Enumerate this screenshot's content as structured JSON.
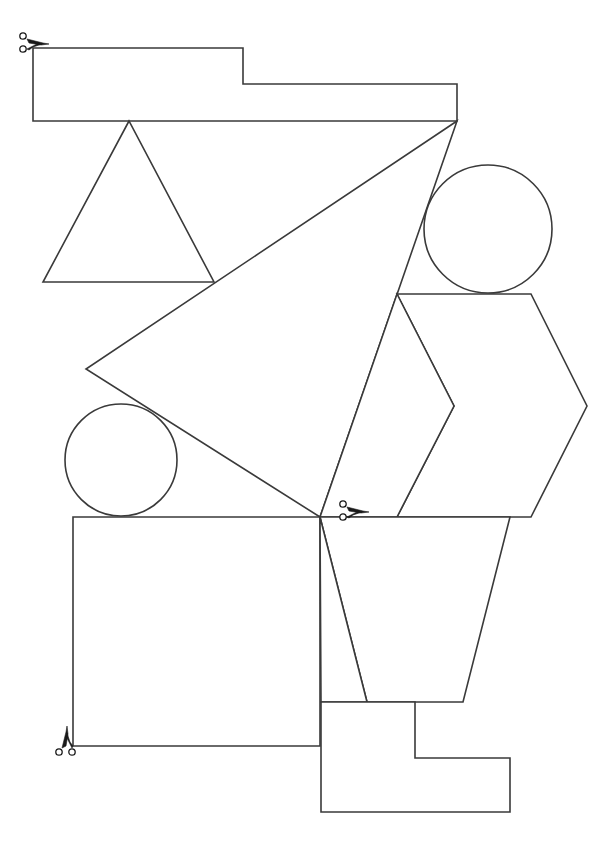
{
  "diagram": {
    "background": "#ffffff",
    "stroke_color": "#3a3a3a",
    "icon_color": "#1a1a1a",
    "shapes": [
      {
        "id": "stepped-bar",
        "type": "polygon",
        "points": "33,48 243,48 243,84 457,84 457,121 33,121"
      },
      {
        "id": "small-triangle",
        "type": "polygon",
        "points": "129,121 43,282 214,282"
      },
      {
        "id": "large-triangle",
        "type": "polygon",
        "points": "457,121 86,369 320,517"
      },
      {
        "id": "upper-circle",
        "type": "circle",
        "cx": 488,
        "cy": 229,
        "r": 64
      },
      {
        "id": "chevron-hexagon",
        "type": "polygon",
        "points": "397,294 531,294 587,406 531,517 397,517 454,406"
      },
      {
        "id": "sliver-quad",
        "type": "polygon",
        "points": "397,294 454,406 397,517 320,517"
      },
      {
        "id": "lower-circle",
        "type": "circle",
        "cx": 121,
        "cy": 460,
        "r": 56
      },
      {
        "id": "square",
        "type": "polygon",
        "points": "73,517 320,517 320,746 73,746"
      },
      {
        "id": "trapezoid",
        "type": "polygon",
        "points": "320,517 510,517 463,702 367,702"
      },
      {
        "id": "left-sliver",
        "type": "polygon",
        "points": "320,517 367,702 321,702"
      },
      {
        "id": "l-block",
        "type": "polygon",
        "points": "321,702 415,702 415,758 510,758 510,812 321,812"
      }
    ],
    "scissors": [
      {
        "id": "scissors-top-left",
        "x": 33,
        "y": 44,
        "rotation": 0
      },
      {
        "id": "scissors-middle",
        "x": 353,
        "y": 512,
        "rotation": 0
      },
      {
        "id": "scissors-bottom-left",
        "x": 67,
        "y": 742,
        "rotation": -90
      }
    ]
  }
}
